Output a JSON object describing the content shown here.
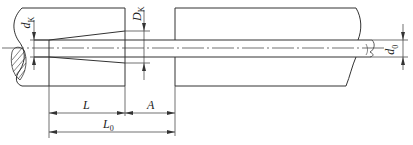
{
  "diagram": {
    "type": "mechanical section drawing",
    "line_color": "#333333",
    "labels": {
      "dk": {
        "main": "d",
        "sub": "K"
      },
      "Dk": {
        "main": "D",
        "sub": "K"
      },
      "d0": {
        "main": "d",
        "sub": "0"
      },
      "L": {
        "main": "L"
      },
      "A": {
        "main": "A"
      },
      "L0": {
        "main": "L",
        "sub": "0"
      }
    },
    "dimensions": [
      {
        "name": "L",
        "from_x": 49,
        "to_x": 125,
        "y": 113
      },
      {
        "name": "A",
        "from_x": 125,
        "to_x": 175,
        "y": 113
      },
      {
        "name": "L0",
        "from_x": 49,
        "to_x": 175,
        "y": 132
      }
    ]
  }
}
